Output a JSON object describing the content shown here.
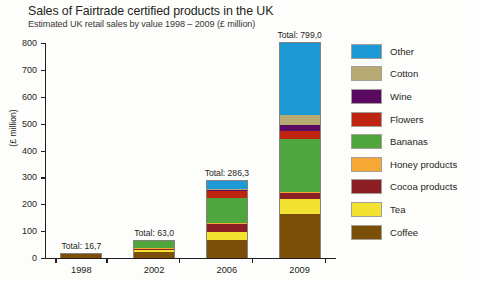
{
  "header": {
    "title": "Sales of Fairtrade certified products in the UK",
    "subtitle": "Estimated UK retail sales by value 1998 – 2009 (£ million)"
  },
  "axis": {
    "y_label": "(£ million)",
    "y_ticks": [
      "800",
      "700",
      "600",
      "500",
      "400",
      "300",
      "200",
      "100",
      "0"
    ],
    "x_ticks": [
      "1998",
      "2002",
      "2006",
      "2009"
    ]
  },
  "totals": [
    {
      "label": "Total: 16,7"
    },
    {
      "label": "Total: 63,0"
    },
    {
      "label": "Total: 286,3"
    },
    {
      "label": "Total: 799,0"
    }
  ],
  "legend": {
    "items": [
      {
        "label": "Other",
        "color": "#1b9ad6"
      },
      {
        "label": "Cotton",
        "color": "#b7aa72"
      },
      {
        "label": "Wine",
        "color": "#5b0a62"
      },
      {
        "label": "Flowers",
        "color": "#bf2411"
      },
      {
        "label": "Bananas",
        "color": "#4fa63c"
      },
      {
        "label": "Honey products",
        "color": "#f7a734"
      },
      {
        "label": "Cocoa products",
        "color": "#8c1f26"
      },
      {
        "label": "Tea",
        "color": "#f2e232"
      },
      {
        "label": "Coffee",
        "color": "#7c4f09"
      }
    ]
  },
  "chart_data": {
    "type": "bar",
    "subtype": "stacked-vertical",
    "title": "Sales of Fairtrade certified products in the UK",
    "subtitle": "Estimated UK retail sales by value 1998 – 2009 (£ million)",
    "xlabel": "",
    "ylabel": "(£ million)",
    "ylim": [
      0,
      800
    ],
    "ytick_step": 100,
    "grid": false,
    "legend_position": "right",
    "categories": [
      "1998",
      "2002",
      "2006",
      "2009"
    ],
    "totals": [
      16.7,
      63.0,
      286.3,
      799.0
    ],
    "total_labels": [
      "Total: 16,7",
      "Total: 63,0",
      "Total: 286,3",
      "Total: 799,0"
    ],
    "stack_order_bottom_to_top": [
      "Coffee",
      "Tea",
      "Cocoa products",
      "Honey products",
      "Bananas",
      "Flowers",
      "Wine",
      "Cotton",
      "Other"
    ],
    "series": [
      {
        "name": "Coffee",
        "color": "#7c4f09",
        "values": [
          13.7,
          23.1,
          65.8,
          163.0
        ]
      },
      {
        "name": "Tea",
        "color": "#f2e232",
        "values": [
          2.0,
          5.5,
          30.1,
          55.0
        ]
      },
      {
        "name": "Cocoa products",
        "color": "#8c1f26",
        "values": [
          1.0,
          6.0,
          29.7,
          25.0
        ]
      },
      {
        "name": "Honey products",
        "color": "#f7a734",
        "values": [
          0.0,
          3.5,
          6.5,
          4.0
        ]
      },
      {
        "name": "Bananas",
        "color": "#4fa63c",
        "values": [
          0.0,
          24.0,
          93.0,
          195.0
        ]
      },
      {
        "name": "Flowers",
        "color": "#bf2411",
        "values": [
          0.0,
          0.0,
          24.0,
          32.0
        ]
      },
      {
        "name": "Wine",
        "color": "#5b0a62",
        "values": [
          0.0,
          0.0,
          2.5,
          22.0
        ]
      },
      {
        "name": "Cotton",
        "color": "#b7aa72",
        "values": [
          0.0,
          0.0,
          4.7,
          35.0
        ]
      },
      {
        "name": "Other",
        "color": "#1b9ad6",
        "values": [
          0.0,
          0.9,
          30.0,
          268.0
        ]
      }
    ]
  }
}
